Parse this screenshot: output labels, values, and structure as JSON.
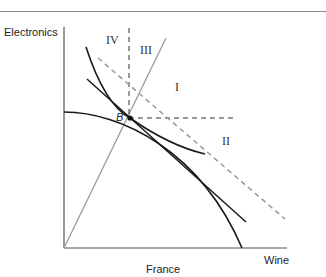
{
  "diagram": {
    "y_axis_label": "Electronics",
    "x_axis_label": "Wine",
    "caption": "France",
    "point_label": "B",
    "regions": {
      "r1": "I",
      "r2": "II",
      "r3": "III",
      "r4": "IV"
    },
    "colors": {
      "axis": "#555555",
      "curve": "#1a1a1a",
      "gray_line": "#9a9a9a",
      "dashed_black": "#333333",
      "rule": "#8a8a8a"
    }
  }
}
